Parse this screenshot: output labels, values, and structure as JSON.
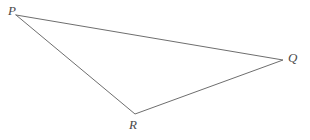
{
  "figure": {
    "type": "geometry-diagram",
    "shape": "triangle",
    "background_color": "#ffffff",
    "stroke_color": "#6e6e6e",
    "label_color": "#4a4a4a",
    "stroke_width": 1,
    "canvas": {
      "width": 310,
      "height": 140
    },
    "vertices": [
      {
        "id": "P",
        "label": "P",
        "x": 16,
        "y": 15,
        "label_x": 8,
        "label_y": 4
      },
      {
        "id": "Q",
        "label": "Q",
        "x": 283,
        "y": 60,
        "label_x": 288,
        "label_y": 51
      },
      {
        "id": "R",
        "label": "R",
        "x": 135,
        "y": 114,
        "label_x": 129,
        "label_y": 118
      }
    ],
    "edges": [
      {
        "id": "PQ",
        "from": "P",
        "to": "Q"
      },
      {
        "id": "QR",
        "from": "Q",
        "to": "R"
      },
      {
        "id": "RP",
        "from": "R",
        "to": "P"
      }
    ],
    "path": "M 16 15 L 283 60 L 135 114 Z"
  }
}
